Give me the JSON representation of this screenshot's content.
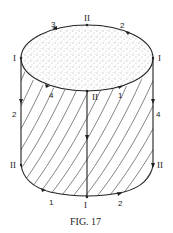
{
  "figure": {
    "caption": "FIG. 17",
    "top_labels": {
      "top_center": "II",
      "top_left_arc": "3",
      "top_right_arc": "2",
      "left_rim": "I",
      "right_rim": "I",
      "front_left_arc": "4",
      "front_center": "II",
      "front_right_arc": "1"
    },
    "side_labels": {
      "left_upper": "2",
      "left_lower": "II",
      "right_upper": "4",
      "right_lower": "II"
    },
    "bottom_labels": {
      "bottom_left_arc": "1",
      "bottom_center": "I",
      "bottom_right_arc": "2"
    },
    "icons": {
      "top_surface": "stippled-disk",
      "side_surface": "diagonal-hatching",
      "arrows": "direction-arrowheads"
    }
  }
}
